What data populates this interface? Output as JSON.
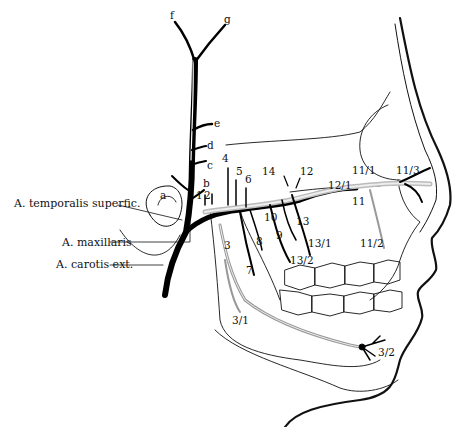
{
  "figure": {
    "colors": {
      "ink": "#111111",
      "vessel_fill": "#000000",
      "nerve_fill": "#d9d9d9",
      "background": "#ffffff"
    },
    "side_labels": [
      {
        "id": "temporalis",
        "text": "A. temporalis superfic."
      },
      {
        "id": "maxillaris",
        "text": "A. maxillaris"
      },
      {
        "id": "carotis",
        "text": "A. carotis ext."
      }
    ],
    "letter_labels": {
      "a": "a",
      "b": "b",
      "c": "c",
      "d": "d",
      "e": "e",
      "f": "f",
      "g": "g"
    },
    "number_labels": {
      "n1": "1",
      "n2": "2",
      "n3": "3",
      "n3_1": "3/1",
      "n3_2": "3/2",
      "n4": "4",
      "n5": "5",
      "n6": "6",
      "n7": "7",
      "n8": "8",
      "n9": "9",
      "n10": "10",
      "n11": "11",
      "n11_1": "11/1",
      "n11_2": "11/2",
      "n11_3": "11/3",
      "n12": "12",
      "n12_1": "12/1",
      "n13": "13",
      "n13_1": "13/1",
      "n13_2": "13/2",
      "n14": "14"
    }
  }
}
